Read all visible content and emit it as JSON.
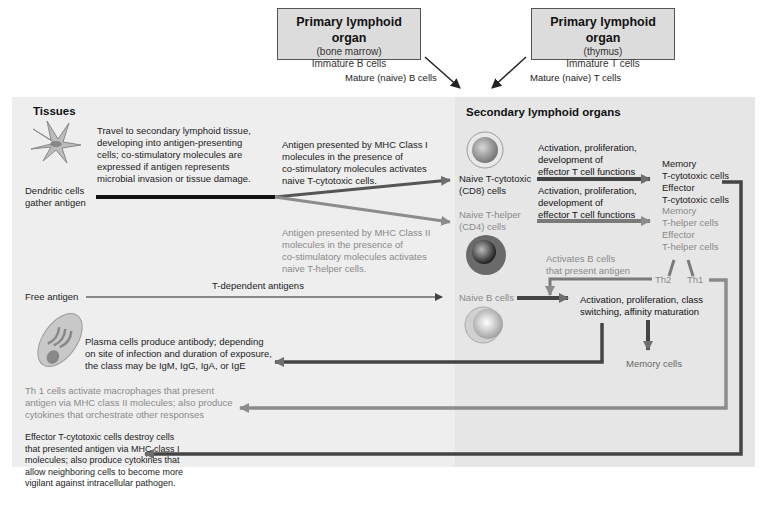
{
  "top_boxes": [
    {
      "title": "Primary lymphoid organ",
      "subtitle": "(bone marrow)",
      "content": "Immature B cells"
    },
    {
      "title": "Primary lymphoid organ",
      "subtitle": "(thymus)",
      "content": "Immature T cells"
    }
  ],
  "top_arrow_labels": {
    "b_cells": "Mature (naive) B cells",
    "t_cells": "Mature (naive) T cells"
  },
  "sections": {
    "tissues": "Tissues",
    "secondary": "Secondary lymphoid organs"
  },
  "tissues": {
    "dendritic_desc": [
      "Travel to secondary lymphoid tissue,",
      "developing into antigen-presenting",
      "cells; co-stimulatory molecules are",
      "expressed if antigen represents",
      "microbial invasion or tissue damage."
    ],
    "dendritic_label": [
      "Dendritic cells",
      "gather antigen"
    ],
    "mhc1_desc": [
      "Antigen presented by MHC Class I",
      "molecules in the presence of",
      "co-stimulatory molecules activates",
      "naive T-cytotoxic cells."
    ],
    "mhc2_desc": [
      "Antigen presented by MHC Class II",
      "molecules in the presence of",
      "co-stimulatory molecules activates",
      "naive T-helper cells."
    ],
    "free_antigen": "Free antigen",
    "t_dependent": "T-dependent antigens",
    "plasma_desc": [
      "Plasma cells produce antibody; depending",
      "on site of infection and duration of exposure,",
      "the class may be IgM, IgG, IgA, or IgE"
    ],
    "th1_desc": [
      "Th 1 cells activate macrophages that present",
      "antigen via MHC class II molecules; also produce",
      "cytokines that orchestrate other responses"
    ],
    "effector_desc": [
      "Effector T-cytotoxic cells destroy cells",
      "that presented antigen via MHC class I",
      "molecules; also produce cytokines that",
      "allow neighboring cells to become more",
      "vigilant against intracellular pathogen."
    ]
  },
  "secondary": {
    "naive_tc": [
      "Naive T-cytotoxic",
      "(CD8) cells"
    ],
    "naive_th": [
      "Naive T-helper",
      "(CD4) cells"
    ],
    "naive_b": "Naive B cells",
    "activation_tc": [
      "Activation, proliferation,",
      "development of",
      "effector T cell functions"
    ],
    "activation_th": [
      "Activation, proliferation,",
      "development of",
      "effector T cell functions"
    ],
    "memory_tc": [
      "Memory",
      "T-cytotoxic cells"
    ],
    "effector_tc": [
      "Effector",
      "T-cytotoxic cells"
    ],
    "memory_th": [
      "Memory",
      "T-helper cells"
    ],
    "effector_th": [
      "Effector",
      "T-helper cells"
    ],
    "th2": "Th2",
    "th1": "Th1",
    "activates_b": [
      "Activates B cells",
      "that present antigen"
    ],
    "b_activation": [
      "Activation, proliferation, class",
      "switching, affinity maturation"
    ],
    "memory_cells": "Memory cells"
  },
  "colors": {
    "dark_arrow": "#444444",
    "mid_arrow": "#6e6e6e",
    "light_arrow": "#8c8c8c",
    "panel_bg": "#eeeeee",
    "box_bg": "#dcdcdc"
  }
}
